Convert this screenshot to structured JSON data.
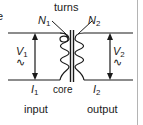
{
  "figure": {
    "background_color": "#ffffff",
    "ink_color": "#1a1a1a",
    "border_color": "#b4b4b4",
    "width": 143,
    "height": 125
  },
  "labels": {
    "clipped_left_text": "e",
    "turns": "turns",
    "primary_turns": "N",
    "primary_turns_sub": "1",
    "secondary_turns": "N",
    "secondary_turns_sub": "2",
    "primary_voltage": "V",
    "primary_voltage_sub": "1",
    "primary_voltage_symbol": "∿",
    "secondary_voltage": "V",
    "secondary_voltage_sub": "2",
    "secondary_voltage_symbol": "∿",
    "primary_current": "I",
    "primary_current_sub": "1",
    "secondary_current": "I",
    "secondary_current_sub": "2",
    "core": "core",
    "input": "input",
    "output": "output"
  }
}
